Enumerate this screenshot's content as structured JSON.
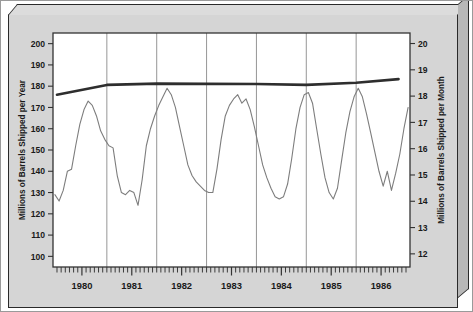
{
  "chart_data": {
    "type": "line",
    "title": "",
    "xlabel": "",
    "ylabel": "Millions of Barrels Shipped per Year",
    "ylabel_right": "Millions of Barrels Shipped per Month",
    "ylim": [
      95,
      205
    ],
    "ylim_right": [
      11.5,
      20.4
    ],
    "yticks": [
      100,
      110,
      120,
      130,
      140,
      150,
      160,
      170,
      180,
      190,
      200
    ],
    "yticks_right": [
      12,
      13,
      14,
      15,
      16,
      17,
      18,
      19,
      20
    ],
    "xlim": [
      1979.42,
      1986.58
    ],
    "xticks_labeled": [
      "1980",
      "1981",
      "1982",
      "1983",
      "1984",
      "1985",
      "1986"
    ],
    "xtick_positions": [
      1980.0,
      1981.0,
      1982.0,
      1983.0,
      1984.0,
      1985.0,
      1986.0
    ],
    "minor_ticks": "monthly",
    "gridlines": {
      "vertical": [
        1980.5,
        1981.5,
        1982.5,
        1983.5,
        1984.5,
        1985.5
      ],
      "horizontal": false
    },
    "series": [
      {
        "name": "Monthly barrels shipped (annual rate)",
        "color": "#7d7d7d",
        "linewidth": 1.1,
        "x": [
          1979.458,
          1979.542,
          1979.625,
          1979.708,
          1979.792,
          1979.875,
          1979.958,
          1980.042,
          1980.125,
          1980.208,
          1980.292,
          1980.375,
          1980.458,
          1980.542,
          1980.625,
          1980.708,
          1980.792,
          1980.875,
          1980.958,
          1981.042,
          1981.125,
          1981.208,
          1981.292,
          1981.375,
          1981.458,
          1981.542,
          1981.625,
          1981.708,
          1981.792,
          1981.875,
          1981.958,
          1982.042,
          1982.125,
          1982.208,
          1982.292,
          1982.375,
          1982.458,
          1982.542,
          1982.625,
          1982.708,
          1982.792,
          1982.875,
          1982.958,
          1983.042,
          1983.125,
          1983.208,
          1983.292,
          1983.375,
          1983.458,
          1983.542,
          1983.625,
          1983.708,
          1983.792,
          1983.875,
          1983.958,
          1984.042,
          1984.125,
          1984.208,
          1984.292,
          1984.375,
          1984.458,
          1984.542,
          1984.625,
          1984.708,
          1984.792,
          1984.875,
          1984.958,
          1985.042,
          1985.125,
          1985.208,
          1985.292,
          1985.375,
          1985.458,
          1985.542,
          1985.625,
          1985.708,
          1985.792,
          1985.875,
          1985.958,
          1986.042,
          1986.125,
          1986.208,
          1986.292,
          1986.375,
          1986.458,
          1986.542
        ],
        "values": [
          129,
          126,
          131,
          140,
          141,
          152,
          162,
          169,
          173,
          171,
          166,
          159,
          155,
          152,
          151,
          138,
          130,
          129,
          131,
          130,
          124,
          136,
          152,
          160,
          166,
          171,
          175,
          179,
          176,
          170,
          161,
          152,
          143,
          138,
          135,
          133,
          131,
          130,
          130,
          141,
          155,
          166,
          171,
          174,
          176,
          172,
          174,
          169,
          161,
          152,
          143,
          137,
          132,
          128,
          127,
          128,
          134,
          146,
          160,
          170,
          176,
          177,
          172,
          160,
          148,
          137,
          130,
          127,
          132,
          145,
          158,
          168,
          175,
          179,
          175,
          167,
          158,
          149,
          140,
          133,
          140,
          131,
          139,
          148,
          160,
          170
        ]
      },
      {
        "name": "Trend (annual total)",
        "color": "#2e2e2e",
        "linewidth": 2.6,
        "x": [
          1979.5,
          1980.5,
          1981.5,
          1982.5,
          1983.5,
          1984.5,
          1985.5,
          1986.35
        ],
        "values": [
          176.0,
          180.6,
          181.2,
          181.1,
          181.0,
          180.6,
          181.6,
          183.3
        ]
      }
    ]
  },
  "labels": {
    "left_axis_title": "Millions of Barrels Shipped per Year",
    "right_axis_title": "Millions of Barrels Shipped per Month"
  },
  "colors": {
    "frame_face": "#d5d5d5",
    "frame_top": "#dcdcdc",
    "frame_side": "#b8b8b8",
    "plot_bg": "#ffffff",
    "axis": "#333333",
    "gridline": "#8a8a8a",
    "data_line": "#7d7d7d",
    "trend_line": "#2e2e2e"
  }
}
